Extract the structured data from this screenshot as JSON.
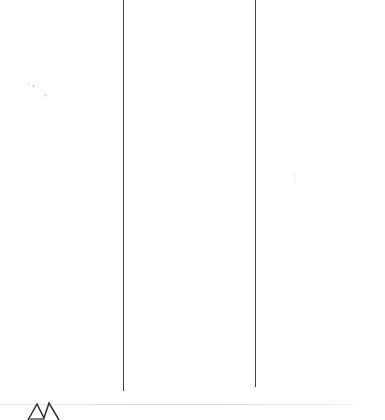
{
  "document": {
    "specks": {
      "left_cluster": "'•",
      "left_plus": "+",
      "right_smudge": "¦"
    }
  },
  "icons": {
    "zigzag_mark": "zigzag-handwritten-mark"
  },
  "colors": {
    "background": "#ffffff",
    "column_divider": "#424242",
    "bottom_rule": "#dedede",
    "ink": "#2e2e2e",
    "speck": "#adadad"
  }
}
